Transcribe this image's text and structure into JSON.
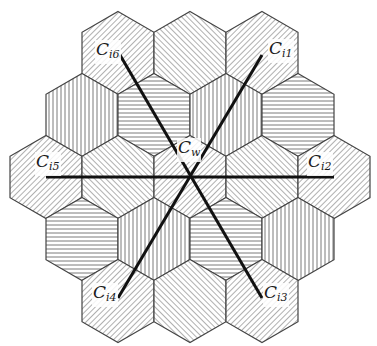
{
  "diagram": {
    "colors": {
      "edge": "#444444",
      "hatch": "#7a7a7a",
      "line": "#111111",
      "background": "#ffffff"
    },
    "geometry": {
      "center_x": 190,
      "center_y": 177,
      "hex_width": 72,
      "hex_radius": 41.5,
      "row_spacing": 62
    },
    "cells": [
      {
        "row": 0,
        "x": 118,
        "y": 53,
        "pattern": "diag-up"
      },
      {
        "row": 0,
        "x": 190,
        "y": 53,
        "pattern": "diag-down"
      },
      {
        "row": 0,
        "x": 262,
        "y": 53,
        "pattern": "diag-up"
      },
      {
        "row": 1,
        "x": 82,
        "y": 115,
        "pattern": "vertical"
      },
      {
        "row": 1,
        "x": 154,
        "y": 115,
        "pattern": "horizontal"
      },
      {
        "row": 1,
        "x": 226,
        "y": 115,
        "pattern": "vertical"
      },
      {
        "row": 1,
        "x": 298,
        "y": 115,
        "pattern": "horizontal"
      },
      {
        "row": 2,
        "x": 46,
        "y": 177,
        "pattern": "diag-up"
      },
      {
        "row": 2,
        "x": 118,
        "y": 177,
        "pattern": "diag-down"
      },
      {
        "row": 2,
        "x": 190,
        "y": 177,
        "pattern": "diag-up"
      },
      {
        "row": 2,
        "x": 262,
        "y": 177,
        "pattern": "diag-down"
      },
      {
        "row": 2,
        "x": 334,
        "y": 177,
        "pattern": "diag-up"
      },
      {
        "row": 3,
        "x": 82,
        "y": 239,
        "pattern": "horizontal"
      },
      {
        "row": 3,
        "x": 154,
        "y": 239,
        "pattern": "vertical"
      },
      {
        "row": 3,
        "x": 226,
        "y": 239,
        "pattern": "horizontal"
      },
      {
        "row": 3,
        "x": 298,
        "y": 239,
        "pattern": "vertical"
      },
      {
        "row": 4,
        "x": 118,
        "y": 301,
        "pattern": "diag-up"
      },
      {
        "row": 4,
        "x": 190,
        "y": 301,
        "pattern": "diag-down"
      },
      {
        "row": 4,
        "x": 262,
        "y": 301,
        "pattern": "diag-up"
      }
    ],
    "lines": [
      {
        "name": "line-i5-i2",
        "x1": 46,
        "y1": 177,
        "x2": 334,
        "y2": 177
      },
      {
        "name": "line-i6-i3",
        "x1": 120,
        "y1": 55,
        "x2": 262,
        "y2": 298
      },
      {
        "name": "line-i4-i1",
        "x1": 118,
        "y1": 298,
        "x2": 262,
        "y2": 55
      }
    ],
    "labels": [
      {
        "id": "w",
        "base": "C",
        "sub": "w",
        "x": 177,
        "y": 138
      },
      {
        "id": "i1",
        "base": "C",
        "sub": "i1",
        "x": 268,
        "y": 39
      },
      {
        "id": "i2",
        "base": "C",
        "sub": "i2",
        "x": 307,
        "y": 152
      },
      {
        "id": "i3",
        "base": "C",
        "sub": "i3",
        "x": 263,
        "y": 283
      },
      {
        "id": "i4",
        "base": "C",
        "sub": "i4",
        "x": 92,
        "y": 283
      },
      {
        "id": "i5",
        "base": "C",
        "sub": "i5",
        "x": 35,
        "y": 152
      },
      {
        "id": "i6",
        "base": "C",
        "sub": "i6",
        "x": 95,
        "y": 40
      }
    ]
  }
}
